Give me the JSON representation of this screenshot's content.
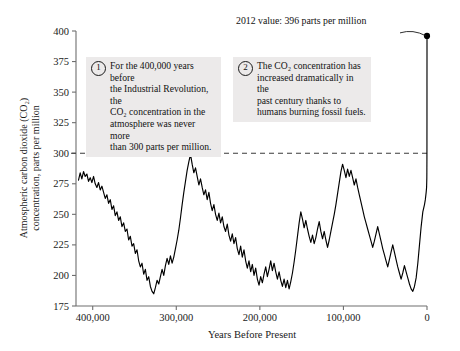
{
  "chart_data": {
    "type": "line",
    "title": "",
    "xlabel": "Years Before Present",
    "ylabel_line1": "Atmospheric carbon dioxide (CO₂)",
    "ylabel_line2": "concentration, parts per million",
    "xlim": [
      420000,
      0
    ],
    "ylim": [
      175,
      400
    ],
    "xticks": [
      400000,
      300000,
      200000,
      100000,
      0
    ],
    "xtick_labels": [
      "400,000",
      "300,000",
      "200,000",
      "100,000",
      "0"
    ],
    "yticks": [
      175,
      200,
      225,
      250,
      275,
      300,
      325,
      350,
      375,
      400
    ],
    "ytick_labels": [
      "175",
      "200",
      "225",
      "250",
      "275",
      "300",
      "325",
      "350",
      "375",
      "400"
    ],
    "x_axis_direction": "reversed",
    "grid": false,
    "legend": "none",
    "reference_line": {
      "y": 300,
      "style": "dashed",
      "label": ""
    },
    "series": [
      {
        "name": "Atmospheric CO2 concentration",
        "color": "#000000",
        "points": [
          [
            417000,
            278
          ],
          [
            415000,
            284
          ],
          [
            413000,
            279
          ],
          [
            411000,
            285
          ],
          [
            409000,
            281
          ],
          [
            407000,
            283
          ],
          [
            405000,
            277
          ],
          [
            403000,
            280
          ],
          [
            401000,
            276
          ],
          [
            399000,
            281
          ],
          [
            397000,
            275
          ],
          [
            395000,
            272
          ],
          [
            393000,
            276
          ],
          [
            391000,
            270
          ],
          [
            389000,
            273
          ],
          [
            387000,
            268
          ],
          [
            385000,
            263
          ],
          [
            383000,
            266
          ],
          [
            381000,
            259
          ],
          [
            379000,
            262
          ],
          [
            377000,
            254
          ],
          [
            375000,
            257
          ],
          [
            373000,
            249
          ],
          [
            371000,
            252
          ],
          [
            369000,
            245
          ],
          [
            367000,
            248
          ],
          [
            365000,
            240
          ],
          [
            363000,
            243
          ],
          [
            361000,
            236
          ],
          [
            359000,
            238
          ],
          [
            357000,
            229
          ],
          [
            355000,
            232
          ],
          [
            353000,
            224
          ],
          [
            351000,
            226
          ],
          [
            349000,
            218
          ],
          [
            347000,
            221
          ],
          [
            345000,
            212
          ],
          [
            343000,
            207
          ],
          [
            341000,
            210
          ],
          [
            339000,
            201
          ],
          [
            337000,
            205
          ],
          [
            335000,
            196
          ],
          [
            333000,
            199
          ],
          [
            331000,
            191
          ],
          [
            329000,
            187
          ],
          [
            327000,
            185
          ],
          [
            325000,
            190
          ],
          [
            323000,
            196
          ],
          [
            321000,
            193
          ],
          [
            319000,
            199
          ],
          [
            317000,
            205
          ],
          [
            315000,
            200
          ],
          [
            313000,
            208
          ],
          [
            311000,
            214
          ],
          [
            309000,
            209
          ],
          [
            307000,
            216
          ],
          [
            305000,
            210
          ],
          [
            303000,
            215
          ],
          [
            301000,
            222
          ],
          [
            299000,
            229
          ],
          [
            297000,
            237
          ],
          [
            295000,
            247
          ],
          [
            293000,
            258
          ],
          [
            291000,
            268
          ],
          [
            289000,
            277
          ],
          [
            287000,
            286
          ],
          [
            285000,
            293
          ],
          [
            283000,
            299
          ],
          [
            281000,
            291
          ],
          [
            279000,
            284
          ],
          [
            277000,
            288
          ],
          [
            275000,
            281
          ],
          [
            273000,
            274
          ],
          [
            271000,
            279
          ],
          [
            269000,
            272
          ],
          [
            267000,
            266
          ],
          [
            265000,
            270
          ],
          [
            263000,
            262
          ],
          [
            261000,
            268
          ],
          [
            259000,
            259
          ],
          [
            257000,
            253
          ],
          [
            255000,
            258
          ],
          [
            253000,
            250
          ],
          [
            251000,
            245
          ],
          [
            249000,
            251
          ],
          [
            247000,
            243
          ],
          [
            245000,
            248
          ],
          [
            243000,
            240
          ],
          [
            241000,
            236
          ],
          [
            239000,
            242
          ],
          [
            237000,
            233
          ],
          [
            235000,
            228
          ],
          [
            233000,
            234
          ],
          [
            231000,
            226
          ],
          [
            229000,
            231
          ],
          [
            227000,
            222
          ],
          [
            225000,
            217
          ],
          [
            223000,
            224
          ],
          [
            221000,
            215
          ],
          [
            219000,
            221
          ],
          [
            217000,
            212
          ],
          [
            215000,
            206
          ],
          [
            213000,
            212
          ],
          [
            211000,
            203
          ],
          [
            209000,
            209
          ],
          [
            207000,
            200
          ],
          [
            205000,
            206
          ],
          [
            203000,
            197
          ],
          [
            201000,
            192
          ],
          [
            199000,
            199
          ],
          [
            197000,
            194
          ],
          [
            195000,
            201
          ],
          [
            193000,
            207
          ],
          [
            191000,
            199
          ],
          [
            189000,
            205
          ],
          [
            187000,
            212
          ],
          [
            185000,
            204
          ],
          [
            183000,
            210
          ],
          [
            181000,
            203
          ],
          [
            179000,
            197
          ],
          [
            177000,
            203
          ],
          [
            175000,
            196
          ],
          [
            173000,
            191
          ],
          [
            171000,
            197
          ],
          [
            169000,
            190
          ],
          [
            167000,
            196
          ],
          [
            165000,
            189
          ],
          [
            163000,
            195
          ],
          [
            161000,
            202
          ],
          [
            159000,
            211
          ],
          [
            157000,
            221
          ],
          [
            155000,
            232
          ],
          [
            153000,
            243
          ],
          [
            151000,
            252
          ],
          [
            149000,
            246
          ],
          [
            147000,
            239
          ],
          [
            145000,
            245
          ],
          [
            143000,
            238
          ],
          [
            141000,
            232
          ],
          [
            139000,
            227
          ],
          [
            137000,
            233
          ],
          [
            135000,
            226
          ],
          [
            133000,
            231
          ],
          [
            131000,
            238
          ],
          [
            129000,
            244
          ],
          [
            127000,
            236
          ],
          [
            125000,
            230
          ],
          [
            123000,
            236
          ],
          [
            121000,
            229
          ],
          [
            119000,
            223
          ],
          [
            117000,
            229
          ],
          [
            115000,
            236
          ],
          [
            113000,
            243
          ],
          [
            111000,
            250
          ],
          [
            109000,
            258
          ],
          [
            107000,
            267
          ],
          [
            105000,
            276
          ],
          [
            103000,
            285
          ],
          [
            101000,
            291
          ],
          [
            99000,
            286
          ],
          [
            97000,
            280
          ],
          [
            95000,
            287
          ],
          [
            93000,
            281
          ],
          [
            91000,
            286
          ],
          [
            89000,
            280
          ],
          [
            87000,
            274
          ],
          [
            85000,
            279
          ],
          [
            83000,
            272
          ],
          [
            81000,
            266
          ],
          [
            79000,
            260
          ],
          [
            77000,
            254
          ],
          [
            75000,
            248
          ],
          [
            73000,
            243
          ],
          [
            71000,
            238
          ],
          [
            69000,
            233
          ],
          [
            67000,
            228
          ],
          [
            65000,
            223
          ],
          [
            63000,
            228
          ],
          [
            61000,
            234
          ],
          [
            59000,
            240
          ],
          [
            57000,
            234
          ],
          [
            55000,
            228
          ],
          [
            53000,
            222
          ],
          [
            51000,
            217
          ],
          [
            49000,
            212
          ],
          [
            47000,
            207
          ],
          [
            45000,
            213
          ],
          [
            43000,
            219
          ],
          [
            41000,
            225
          ],
          [
            39000,
            219
          ],
          [
            37000,
            213
          ],
          [
            35000,
            207
          ],
          [
            33000,
            202
          ],
          [
            31000,
            197
          ],
          [
            29000,
            202
          ],
          [
            27000,
            208
          ],
          [
            25000,
            203
          ],
          [
            23000,
            198
          ],
          [
            21000,
            193
          ],
          [
            19000,
            189
          ],
          [
            17000,
            187
          ],
          [
            15000,
            191
          ],
          [
            13000,
            198
          ],
          [
            11000,
            210
          ],
          [
            9000,
            225
          ],
          [
            7000,
            240
          ],
          [
            5000,
            252
          ],
          [
            3000,
            258
          ],
          [
            2000,
            262
          ],
          [
            1000,
            268
          ],
          [
            500,
            272
          ],
          [
            300,
            277
          ],
          [
            200,
            280
          ],
          [
            150,
            285
          ],
          [
            100,
            295
          ],
          [
            60,
            310
          ],
          [
            40,
            330
          ],
          [
            20,
            355
          ],
          [
            5,
            380
          ],
          [
            0,
            396
          ]
        ]
      }
    ],
    "marker_point": {
      "x": 0,
      "y": 396,
      "label": "2012 value: 396 parts per million"
    }
  },
  "annotations": {
    "value_note": {
      "text": "2012 value: 396 parts per million",
      "leader": true
    },
    "callouts": [
      {
        "number": "1",
        "text": "For the 400,000 years before\nthe Industrial Revolution, the\nCO₂ concentration in the\natmosphere was never more\nthan 300 parts per million."
      },
      {
        "number": "2",
        "text": "The CO₂ concentration has\nincreased dramatically in the\npast century thanks to\nhumans burning fossil fuels."
      }
    ]
  },
  "colors": {
    "line": "#000000",
    "axis": "#6e6e6e",
    "reference_line": "#4a4a4a",
    "callout_background": "#eceaea",
    "text": "#111111",
    "page_background": "#ffffff"
  }
}
